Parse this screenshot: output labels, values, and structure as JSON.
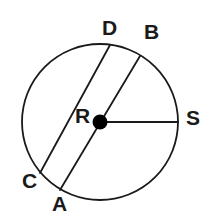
{
  "diagram": {
    "kind": "circle-geometry",
    "background_color": "#ffffff",
    "stroke_color": "#1a1a1a",
    "label_color": "#1a1a1a",
    "canvas": {
      "width": 212,
      "height": 221
    }
  },
  "circle": {
    "name": "main-circle",
    "center_x": 100,
    "center_y": 122,
    "radius": 78,
    "stroke_width": 1.8
  },
  "center_point": {
    "name": "center-point-r",
    "x": 100,
    "y": 122,
    "dot_radius": 7.5,
    "fill": "#000000"
  },
  "segments": [
    {
      "name": "chord-cd",
      "type": "chord",
      "from": "C",
      "to": "D",
      "x1": 40,
      "y1": 173,
      "x2": 110,
      "y2": 45,
      "stroke_width": 1.8,
      "passes_through_center": false
    },
    {
      "name": "diameter-ab",
      "type": "diameter",
      "from": "A",
      "to": "B",
      "x1": 60,
      "y1": 190,
      "x2": 140,
      "y2": 56,
      "stroke_width": 1.8,
      "passes_through_center": true
    },
    {
      "name": "radius-rs",
      "type": "radius",
      "from": "R",
      "to": "S",
      "x1": 100,
      "y1": 122,
      "x2": 178,
      "y2": 122,
      "stroke_width": 2.0,
      "passes_through_center": true
    }
  ],
  "labels": [
    {
      "name": "label-d",
      "text": "D",
      "x": 102,
      "y": 17
    },
    {
      "name": "label-b",
      "text": "B",
      "x": 144,
      "y": 21
    },
    {
      "name": "label-r",
      "text": "R",
      "x": 75,
      "y": 105
    },
    {
      "name": "label-s",
      "text": "S",
      "x": 186,
      "y": 107
    },
    {
      "name": "label-c",
      "text": "C",
      "x": 22,
      "y": 170
    },
    {
      "name": "label-a",
      "text": "A",
      "x": 52,
      "y": 193
    }
  ]
}
